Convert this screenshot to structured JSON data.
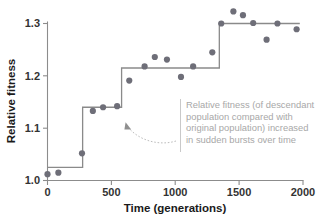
{
  "chart_data": {
    "type": "scatter",
    "title": "",
    "xlabel": "Time (generations)",
    "ylabel": "Relative fitness",
    "xlim": [
      0,
      2000
    ],
    "ylim": [
      1.0,
      1.3
    ],
    "xticks": [
      0,
      500,
      1000,
      1500,
      2000
    ],
    "xtick_labels": [
      "0",
      "500",
      "1000",
      "1500",
      "2000"
    ],
    "yticks": [
      1.0,
      1.1,
      1.2,
      1.3
    ],
    "ytick_labels": [
      "1.0",
      "1.1",
      "1.2",
      "1.3"
    ],
    "grid": false,
    "legend": null,
    "marker_color": "#6e6e78",
    "line_color": "#8a8a8a",
    "points": [
      {
        "x": 0,
        "y": 1.012
      },
      {
        "x": 85,
        "y": 1.015
      },
      {
        "x": 270,
        "y": 1.052
      },
      {
        "x": 355,
        "y": 1.133
      },
      {
        "x": 435,
        "y": 1.14
      },
      {
        "x": 545,
        "y": 1.142
      },
      {
        "x": 640,
        "y": 1.191
      },
      {
        "x": 760,
        "y": 1.218
      },
      {
        "x": 840,
        "y": 1.236
      },
      {
        "x": 935,
        "y": 1.231
      },
      {
        "x": 1045,
        "y": 1.198
      },
      {
        "x": 1140,
        "y": 1.218
      },
      {
        "x": 1290,
        "y": 1.245
      },
      {
        "x": 1360,
        "y": 1.3
      },
      {
        "x": 1455,
        "y": 1.323
      },
      {
        "x": 1530,
        "y": 1.316
      },
      {
        "x": 1610,
        "y": 1.301
      },
      {
        "x": 1715,
        "y": 1.269
      },
      {
        "x": 1800,
        "y": 1.3
      },
      {
        "x": 1950,
        "y": 1.289
      }
    ],
    "step_line": {
      "description": "step function of fitness plateaus with sudden jumps",
      "segments": [
        {
          "x_start": 0,
          "x_end": 275,
          "y": 1.025
        },
        {
          "x_start": 275,
          "x_end": 580,
          "y": 1.14
        },
        {
          "x_start": 580,
          "x_end": 1345,
          "y": 1.215
        },
        {
          "x_start": 1345,
          "x_end": 1975,
          "y": 1.3
        }
      ]
    },
    "annotation": {
      "lines": [
        "Relative fitness (of descendant",
        "population compared with",
        "original population) increased",
        "in sudden bursts over time"
      ],
      "color": "#a8a8a8",
      "points_to": {
        "x": 580,
        "y": 1.14
      }
    }
  }
}
